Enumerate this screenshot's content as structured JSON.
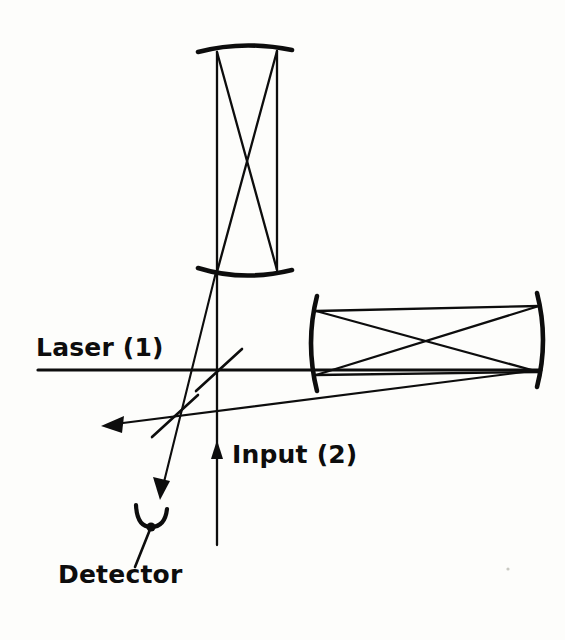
{
  "figure": {
    "kind": "optical-setup-schematic",
    "background_color": "#fdfdfb",
    "ink_color": "#0d0d0d",
    "width": 565,
    "height": 640
  },
  "labels": {
    "laser": "Laser (1)",
    "input": "Input (2)",
    "detector": "Detector"
  },
  "components": {
    "vertical_cavity": {
      "name": "vertical-optical-cavity",
      "top_mirror": "concave-arc-mirror-top",
      "bottom_mirror": "concave-arc-mirror-bottom",
      "ray_pattern": "bowtie-crossing"
    },
    "horizontal_cavity": {
      "name": "horizontal-optical-cavity",
      "left_mirror": "concave-arc-mirror-left",
      "right_mirror": "concave-arc-mirror-right",
      "ray_pattern": "bowtie-crossing"
    },
    "beam_splitters": [
      "beam-splitter-upper",
      "beam-splitter-lower"
    ],
    "detector_symbol": "detector-cup-icon",
    "arrows": [
      "input-beam-arrow-up",
      "output-beam-arrow-left",
      "detector-beam-arrow-down"
    ]
  }
}
